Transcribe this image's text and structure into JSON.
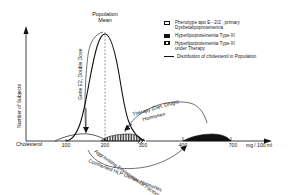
{
  "title": {
    "line1": "Population",
    "line2": "Mean"
  },
  "axes": {
    "y_label": "Number of Subjects",
    "x_label": "Cholesterol",
    "x_unit": "mg / 100 ml",
    "x_ticks": [
      "100",
      "200",
      "300",
      "400",
      "700"
    ],
    "axis_break": "//"
  },
  "annotations": {
    "gene_dose": "Gene E2, Double Dose",
    "therapy": "Therapy (Diet, Drugs)",
    "hormones": "Hormones",
    "aggravating": "Aggravating Environmental Factors",
    "coinherited": "Coinherited HLP-Genes, Hormones"
  },
  "legend": {
    "items": [
      {
        "icon": "open-box-icon",
        "line1": "Phenotype apo E - 2/2 , primary",
        "line2": "Dysbetalipoproteinemia"
      },
      {
        "icon": "solid-box-icon",
        "line1": "Hyperlipoproteinemia Type III",
        "line2": ""
      },
      {
        "icon": "hatched-box-icon",
        "line1": "Hyperlipoproteinemia Type III",
        "line2": "under Therapy"
      },
      {
        "icon": "line-icon",
        "line1": "Distribution of cholesterol in Population",
        "line2": ""
      }
    ]
  },
  "colors": {
    "ink": "#111111",
    "background": "#ffffff"
  }
}
